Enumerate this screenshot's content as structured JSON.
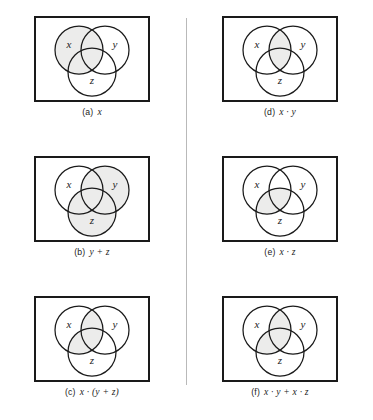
{
  "figure": {
    "name": "venn-diagram-boolean-distributive-law",
    "columns": 2,
    "rows": 3,
    "shade_color": "#ececeb",
    "outline_color": "#1a1a1a",
    "border_color": "#1a1a1a",
    "divider_color": "#b9b9b9",
    "background": "#ffffff"
  },
  "circle_labels": {
    "x": "x",
    "y": "y",
    "z": "z"
  },
  "panels": [
    {
      "id": "a",
      "tag": "(a)",
      "expr": "x",
      "expression_plain": "x",
      "shaded_regions": [
        "x_only",
        "xy_only",
        "xz_only",
        "xyz"
      ],
      "description": "set x fully shaded"
    },
    {
      "id": "b",
      "tag": "(b)",
      "expr": "y + z",
      "expression_plain": "y + z",
      "shaded_regions": [
        "y_only",
        "z_only",
        "xy_only",
        "xz_only",
        "yz_only",
        "xyz"
      ],
      "description": "union of y and z shaded"
    },
    {
      "id": "c",
      "tag": "(c)",
      "expr": "x · (y + z)",
      "expression_plain": "x . (y + z)",
      "shaded_regions": [
        "xy_only",
        "xz_only",
        "xyz"
      ],
      "description": "intersection of x with union of y and z"
    },
    {
      "id": "d",
      "tag": "(d)",
      "expr": "x · y",
      "expression_plain": "x . y",
      "shaded_regions": [
        "xy_only",
        "xyz"
      ],
      "description": "intersection of x and y"
    },
    {
      "id": "e",
      "tag": "(e)",
      "expr": "x · z",
      "expression_plain": "x . z",
      "shaded_regions": [
        "xz_only",
        "xyz"
      ],
      "description": "intersection of x and z"
    },
    {
      "id": "f",
      "tag": "(f)",
      "expr": "x · y + x · z",
      "expression_plain": "x . y + x . z",
      "shaded_regions": [
        "xy_only",
        "xz_only",
        "xyz"
      ],
      "description": "union of x-and-y with x-and-z"
    }
  ]
}
